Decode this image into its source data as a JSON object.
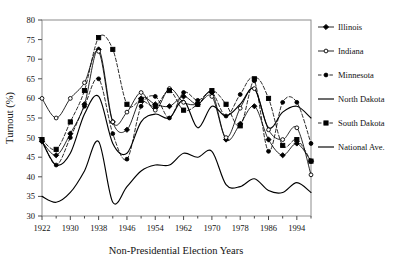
{
  "chart_data": {
    "type": "line",
    "title": "",
    "xlabel": "Non-Presidential Election Years",
    "ylabel": "Turnout (%)",
    "xlim": [
      1922,
      1998
    ],
    "ylim": [
      30,
      80
    ],
    "ytick_step": 5,
    "xtick_step": 4,
    "xtick_label_step": 8,
    "grid": false,
    "legend_position": "right",
    "x": [
      1922,
      1926,
      1930,
      1934,
      1938,
      1942,
      1946,
      1950,
      1954,
      1958,
      1962,
      1966,
      1970,
      1974,
      1978,
      1982,
      1986,
      1990,
      1994,
      1998
    ],
    "yticks": [
      30,
      35,
      40,
      45,
      50,
      55,
      60,
      65,
      70,
      75,
      80
    ],
    "xticks": [
      1922,
      1926,
      1930,
      1934,
      1938,
      1942,
      1946,
      1950,
      1954,
      1958,
      1962,
      1966,
      1970,
      1974,
      1978,
      1982,
      1986,
      1990,
      1994,
      1998
    ],
    "xtick_labels": [
      "1922",
      "",
      "1930",
      "",
      "1938",
      "",
      "1946",
      "",
      "1954",
      "",
      "1962",
      "",
      "1970",
      "",
      "1978",
      "",
      "1986",
      "",
      "1994",
      ""
    ],
    "series": [
      {
        "name": "Illinois",
        "marker": "diamond",
        "marker_filled": true,
        "dash": "solid",
        "color": "#000000",
        "values": [
          49.0,
          45.5,
          51.0,
          58.5,
          72.5,
          54.0,
          52.0,
          60.0,
          58.5,
          58.0,
          60.5,
          58.5,
          61.5,
          49.5,
          53.5,
          58.0,
          49.5,
          45.5,
          48.5,
          44.0
        ]
      },
      {
        "name": "Indiana",
        "marker": "circle",
        "marker_filled": false,
        "dash": "solid",
        "color": "#000000",
        "values": [
          60.0,
          55.0,
          60.0,
          64.0,
          72.0,
          54.0,
          56.5,
          61.5,
          57.0,
          62.5,
          59.0,
          58.5,
          60.5,
          50.0,
          57.5,
          62.5,
          52.0,
          49.5,
          52.5,
          40.5
        ]
      },
      {
        "name": "Minnesota",
        "marker": "circle",
        "marker_filled": true,
        "dash": "dashed",
        "color": "#000000",
        "values": [
          49.5,
          43.0,
          50.0,
          58.0,
          65.0,
          51.0,
          44.5,
          58.0,
          60.5,
          55.0,
          61.5,
          59.5,
          61.5,
          55.5,
          61.0,
          64.5,
          46.5,
          59.0,
          59.0,
          48.5
        ]
      },
      {
        "name": "North Dakota",
        "marker": "none",
        "marker_filled": false,
        "dash": "solid",
        "color": "#000000",
        "values": [
          49.0,
          43.0,
          46.0,
          56.0,
          60.5,
          48.5,
          46.0,
          54.0,
          56.0,
          55.0,
          59.5,
          52.5,
          58.0,
          55.5,
          58.5,
          62.5,
          52.5,
          56.5,
          58.0,
          55.0
        ]
      },
      {
        "name": "South Dakota",
        "marker": "square",
        "marker_filled": true,
        "dash": "dashed",
        "color": "#000000",
        "values": [
          49.5,
          47.0,
          54.0,
          62.0,
          75.5,
          72.5,
          58.5,
          59.5,
          58.0,
          62.0,
          57.0,
          58.5,
          62.0,
          58.5,
          53.0,
          65.0,
          60.0,
          48.0,
          49.5,
          44.0
        ]
      },
      {
        "name": "National Ave.",
        "marker": "none",
        "marker_filled": false,
        "dash": "solid",
        "color": "#000000",
        "values": [
          35.0,
          33.5,
          36.0,
          41.5,
          49.0,
          33.5,
          37.5,
          41.5,
          43.0,
          43.0,
          46.0,
          45.0,
          46.5,
          38.0,
          37.5,
          39.5,
          36.5,
          36.0,
          38.5,
          36.0
        ]
      }
    ]
  },
  "legend": {
    "items": [
      {
        "label": "Illinois"
      },
      {
        "label": "Indiana"
      },
      {
        "label": "Minnesota"
      },
      {
        "label": "North Dakota"
      },
      {
        "label": "South Dakota"
      },
      {
        "label": "National Ave."
      }
    ]
  },
  "axes": {
    "y_title": "Turnout (%)",
    "x_title": "Non-Presidential Election Years"
  }
}
